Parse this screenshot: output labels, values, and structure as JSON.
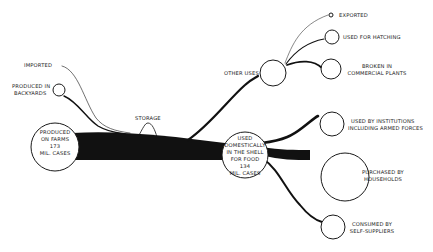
{
  "diagram": {
    "type": "flow",
    "nodes": {
      "imported": {
        "label": "IMPORTED"
      },
      "backyards": {
        "label_line1": "PRODUCED IN",
        "label_line2": "BACKYARDS"
      },
      "farms": {
        "line1": "PRODUCED",
        "line2": "ON FARMS",
        "line3": "173",
        "line4": "MIL. CASES"
      },
      "storage": {
        "label": "STORAGE"
      },
      "other_uses": {
        "label": "OTHER USES"
      },
      "exported": {
        "label": "EXPORTED"
      },
      "hatching": {
        "label": "USED FOR HATCHING"
      },
      "broken": {
        "label_line1": "BROKEN IN",
        "label_line2": "COMMERCIAL PLANTS"
      },
      "domestic": {
        "line1": "USED",
        "line2": "DOMESTICALLY",
        "line3": "IN THE SHELL",
        "line4": "FOR FOOD",
        "line5": "134",
        "line6": "MIL. CASES"
      },
      "institutions": {
        "label_line1": "USED BY INSTITUTIONS",
        "label_line2": "INCLUDING ARMED FORCES"
      },
      "households": {
        "label_line1": "PURCHASED BY",
        "label_line2": "HOUSEHOLDS"
      },
      "self_suppliers": {
        "label_line1": "CONSUMED BY",
        "label_line2": "SELF-SUPPLIERS"
      }
    },
    "values": {
      "produced_on_farms_mil_cases": 173,
      "used_domestically_mil_cases": 134
    },
    "colors": {
      "ink": "#111111",
      "background": "#ffffff"
    }
  }
}
